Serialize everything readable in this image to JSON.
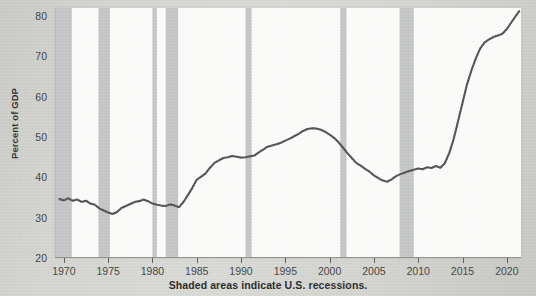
{
  "figure": {
    "caption": "Shaded areas indicate U.S. recessions.",
    "background_color": "#d3d3cf",
    "plot_background_color": "#fbfbfa",
    "line_color": "#4d4e50",
    "recession_band_color": "#c3c4c6"
  },
  "chart_data": {
    "type": "line",
    "title": "",
    "subtitle": "",
    "xlabel": "",
    "ylabel": "Percent of GDP",
    "annotations": [
      "Shaded areas indicate U.S. recessions."
    ],
    "grid": false,
    "legend": false,
    "legend_position": "none",
    "xlim": [
      1969.0,
      2021.6
    ],
    "ylim": [
      20,
      82
    ],
    "xticks": [
      1970,
      1975,
      1980,
      1985,
      1990,
      1995,
      2000,
      2005,
      2010,
      2015,
      2020
    ],
    "xtick_labels": [
      "1970",
      "1975",
      "1980",
      "1985",
      "1990",
      "1995",
      "2000",
      "2005",
      "2010",
      "2015",
      "2020"
    ],
    "yticks": [
      20,
      30,
      40,
      50,
      60,
      70,
      80
    ],
    "ytick_labels": [
      "20",
      "30",
      "40",
      "50",
      "60",
      "70",
      "80"
    ],
    "series": [
      {
        "name": "Federal debt as percent of GDP",
        "color": "#4d4e50",
        "x": [
          1969.5,
          1970.0,
          1970.5,
          1971.0,
          1971.5,
          1972.0,
          1972.5,
          1973.0,
          1973.5,
          1974.0,
          1974.5,
          1975.0,
          1975.5,
          1976.0,
          1976.5,
          1977.0,
          1977.5,
          1978.0,
          1978.5,
          1979.0,
          1979.5,
          1980.0,
          1980.5,
          1981.0,
          1981.5,
          1982.0,
          1982.5,
          1983.0,
          1983.5,
          1984.0,
          1984.5,
          1985.0,
          1985.5,
          1986.0,
          1986.5,
          1987.0,
          1987.5,
          1988.0,
          1988.5,
          1989.0,
          1989.5,
          1990.0,
          1990.5,
          1991.0,
          1991.5,
          1992.0,
          1992.5,
          1993.0,
          1993.5,
          1994.0,
          1994.5,
          1995.0,
          1995.5,
          1996.0,
          1996.5,
          1997.0,
          1997.5,
          1998.0,
          1998.5,
          1999.0,
          1999.5,
          2000.0,
          2000.5,
          2001.0,
          2001.5,
          2002.0,
          2002.5,
          2003.0,
          2003.5,
          2004.0,
          2004.5,
          2005.0,
          2005.5,
          2006.0,
          2006.5,
          2007.0,
          2007.5,
          2008.0,
          2008.5,
          2009.0,
          2009.5,
          2010.0,
          2010.5,
          2011.0,
          2011.5,
          2012.0,
          2012.5,
          2013.0,
          2013.5,
          2014.0,
          2014.5,
          2015.0,
          2015.5,
          2016.0,
          2016.5,
          2017.0,
          2017.5,
          2018.0,
          2018.5,
          2019.0,
          2019.5,
          2020.0,
          2020.5,
          2021.0,
          2021.4
        ],
        "y": [
          34.6,
          34.3,
          34.8,
          34.2,
          34.5,
          33.9,
          34.2,
          33.5,
          33.2,
          32.3,
          31.8,
          31.3,
          30.9,
          31.4,
          32.4,
          32.9,
          33.4,
          33.9,
          34.1,
          34.5,
          34.1,
          33.5,
          33.2,
          33.0,
          32.9,
          33.3,
          33.0,
          32.6,
          33.9,
          35.6,
          37.4,
          39.4,
          40.2,
          41.0,
          42.4,
          43.6,
          44.2,
          44.8,
          45.0,
          45.3,
          45.1,
          44.9,
          45.0,
          45.2,
          45.4,
          46.2,
          46.9,
          47.6,
          47.9,
          48.2,
          48.6,
          49.1,
          49.6,
          50.2,
          50.8,
          51.5,
          52.0,
          52.2,
          52.1,
          51.8,
          51.3,
          50.6,
          49.8,
          48.7,
          47.4,
          46.0,
          44.8,
          43.6,
          42.9,
          42.1,
          41.4,
          40.5,
          39.8,
          39.2,
          38.9,
          39.5,
          40.3,
          40.8,
          41.2,
          41.6,
          41.9,
          42.2,
          42.0,
          42.5,
          42.3,
          42.8,
          42.4,
          43.5,
          46.0,
          49.5,
          54.0,
          58.5,
          63.0,
          66.5,
          69.5,
          72.0,
          73.5,
          74.2,
          74.8,
          75.2,
          75.6,
          76.8,
          78.4,
          80.0,
          81.2
        ]
      }
    ],
    "shaded_regions": [
      {
        "label": "1969-1970 recession",
        "x0": 1969.0,
        "x1": 1970.9
      },
      {
        "label": "1973-1975 recession",
        "x0": 1973.9,
        "x1": 1975.2
      },
      {
        "label": "1980 recession",
        "x0": 1980.0,
        "x1": 1980.5
      },
      {
        "label": "1981-1982 recession",
        "x0": 1981.5,
        "x1": 1982.9
      },
      {
        "label": "1990-1991 recession",
        "x0": 1990.5,
        "x1": 1991.2
      },
      {
        "label": "2001 recession",
        "x0": 2001.2,
        "x1": 2001.9
      },
      {
        "label": "2007-2009 recession",
        "x0": 2007.9,
        "x1": 2009.5
      }
    ]
  }
}
